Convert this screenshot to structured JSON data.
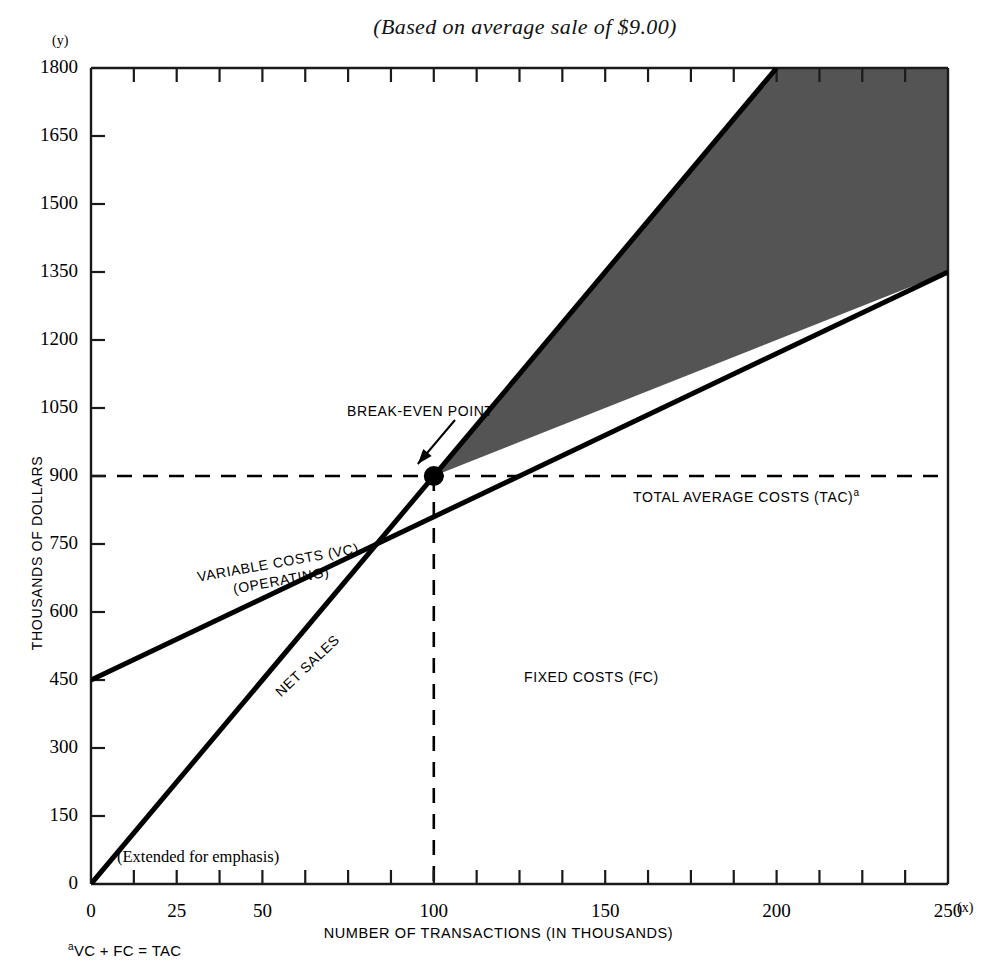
{
  "title": "(Based on average sale of $9.00)",
  "axes": {
    "y_paren": "(y)",
    "x_paren": "(x)",
    "y_axis_title": "THOUSANDS OF DOLLARS",
    "x_axis_title": "NUMBER OF TRANSACTIONS  (IN THOUSANDS)",
    "y_ticks": [
      0,
      150,
      300,
      450,
      600,
      750,
      900,
      1050,
      1200,
      1350,
      1500,
      1650,
      1800
    ],
    "x_ticks_labeled": [
      0,
      25,
      50,
      100,
      150,
      200,
      250
    ],
    "x_ticks_all": [
      0,
      12.5,
      25,
      37.5,
      50,
      62.5,
      75,
      87.5,
      100,
      112.5,
      125,
      137.5,
      150,
      162.5,
      175,
      187.5,
      200,
      212.5,
      225,
      237.5,
      250
    ]
  },
  "annotations": {
    "break_even": "BREAK-EVEN POINT",
    "total_average_costs": "TOTAL AVERAGE COSTS (TAC)",
    "total_average_costs_fn": "a",
    "variable_costs_line1": "VARIABLE COSTS (VC)",
    "variable_costs_line2": "(OPERATING)",
    "net_sales": "NET SALES",
    "fixed_costs": "FIXED COSTS (FC)",
    "extended": "(Extended for emphasis)"
  },
  "footnote": {
    "marker": "a",
    "text": "VC + FC = TAC"
  },
  "colors": {
    "ink": "#000000",
    "shade": "#545454"
  },
  "chart_data": {
    "type": "line",
    "title": "(Based on average sale of $9.00)",
    "xlabel": "NUMBER OF TRANSACTIONS  (IN THOUSANDS)",
    "ylabel": "THOUSANDS OF DOLLARS",
    "xlim": [
      0,
      250
    ],
    "ylim": [
      0,
      1800
    ],
    "grid": false,
    "legend": "inline-labels",
    "series": [
      {
        "name": "NET SALES",
        "points": [
          [
            0,
            0
          ],
          [
            100,
            900
          ],
          [
            200,
            1800
          ]
        ],
        "note": "Revenue line, slope $9.00 per transaction; drawn to top of chart at x=200 (y=1800)"
      },
      {
        "name": "TOTAL AVERAGE COSTS (TAC) = VARIABLE COSTS (VC) + FIXED COSTS (FC)",
        "points": [
          [
            0,
            450
          ],
          [
            100,
            900
          ],
          [
            250,
            1350
          ]
        ],
        "note": "Starts at fixed costs 450; slope $3.60 per transaction"
      },
      {
        "name": "FIXED COSTS (FC)",
        "points": [
          [
            0,
            450
          ],
          [
            250,
            450
          ]
        ],
        "note": "Vertical dashed reference at x=100 marks fixed-cost portion below break-even"
      }
    ],
    "markers": [
      {
        "label": "BREAK-EVEN POINT",
        "x": 100,
        "y": 900
      }
    ],
    "reference_lines": [
      {
        "orientation": "horizontal",
        "value": 900,
        "style": "dashed"
      },
      {
        "orientation": "vertical",
        "value": 100,
        "style": "dashed"
      }
    ],
    "shaded_regions": [
      {
        "label": "profit wedge",
        "between": [
          "NET SALES",
          "TAC"
        ],
        "x_range": [
          100,
          250
        ],
        "color": "#545454"
      }
    ]
  }
}
